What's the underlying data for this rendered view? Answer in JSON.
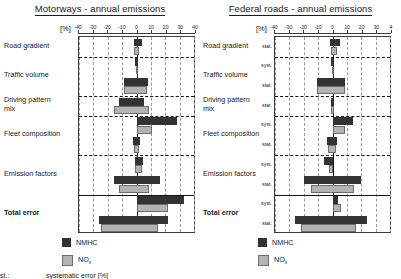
{
  "figure": {
    "footnote_key": "st.:",
    "footnote_text": "systematic error [%]"
  },
  "legend": {
    "items": [
      {
        "label": "NMHC",
        "sub": "",
        "color": "#333333",
        "name": "nmhc"
      },
      {
        "label": "NO",
        "sub": "x",
        "color": "#b3b3b3",
        "name": "nox"
      }
    ]
  },
  "axis": {
    "unit": "[%]",
    "ticks": [
      -40,
      -30,
      -20,
      -10,
      0,
      10,
      20,
      30,
      40
    ],
    "tick_labels_left": [
      "-40",
      "-30",
      "-20",
      "-10",
      "0",
      "10",
      "20",
      "30",
      "40"
    ],
    "tick_labels_right": [
      "-40",
      "-30",
      "-20",
      "-10",
      "0",
      "10",
      "20",
      "30",
      "4"
    ],
    "min": -40,
    "max": 40
  },
  "categories": [
    {
      "label": "Road gradient",
      "bold": false
    },
    {
      "label": "Traffic volume",
      "bold": false
    },
    {
      "label": "Driving pattern\nmix",
      "bold": false
    },
    {
      "label": "Fleet composition",
      "bold": false
    },
    {
      "label": "Emission factors",
      "bold": false
    },
    {
      "label": "Total error",
      "bold": true
    }
  ],
  "row_sublabels": [
    "stat.",
    "syst.",
    "stat.",
    "stat.",
    "syst.",
    "stat.",
    "syst.",
    "stat.",
    "syst.",
    "stat."
  ],
  "chart_data": [
    {
      "type": "bar",
      "orientation": "horizontal",
      "title": "Motorways - annual emissions",
      "xlabel": "[%]",
      "ylabel": "",
      "xlim": [
        -40,
        40
      ],
      "grid": true,
      "legend_position": "bottom-center",
      "categories": [
        "Road gradient",
        "Traffic volume",
        "Driving pattern mix",
        "Fleet composition",
        "Emission factors",
        "Total error"
      ],
      "rows": [
        {
          "category": "Road gradient",
          "error_type": "stat.",
          "nmhc": [
            -2.0,
            4.0
          ],
          "nox": [
            -1.5,
            2.0
          ]
        },
        {
          "category": "Traffic volume",
          "error_type": "syst.",
          "nmhc": [
            -0.8,
            0.8
          ],
          "nox": [
            -0.6,
            0.6
          ]
        },
        {
          "category": "Traffic volume",
          "error_type": "stat.",
          "nmhc": [
            -9.0,
            8.0
          ],
          "nox": [
            -9.0,
            7.0
          ]
        },
        {
          "category": "Driving pattern mix",
          "error_type": "stat.",
          "nmhc": [
            -12.0,
            5.0
          ],
          "nox": [
            -16.0,
            9.0
          ]
        },
        {
          "category": "Fleet composition",
          "error_type": "syst.",
          "nmhc": [
            0.0,
            28.0
          ],
          "nox": [
            0.0,
            11.0
          ]
        },
        {
          "category": "Fleet composition",
          "error_type": "stat.",
          "nmhc": [
            -2.5,
            2.5
          ],
          "nox": [
            -1.5,
            1.5
          ]
        },
        {
          "category": "Emission factors",
          "error_type": "syst.",
          "nmhc": [
            -1.0,
            4.5
          ],
          "nox": [
            -1.0,
            3.5
          ]
        },
        {
          "category": "Emission factors",
          "error_type": "stat.",
          "nmhc": [
            -16.0,
            16.0
          ],
          "nox": [
            -12.0,
            9.0
          ]
        },
        {
          "category": "Total error",
          "error_type": "syst.",
          "nmhc": [
            0.0,
            33.0
          ],
          "nox": [
            0.0,
            22.0
          ]
        },
        {
          "category": "Total error",
          "error_type": "stat.",
          "nmhc": [
            -26.0,
            22.0
          ],
          "nox": [
            -25.0,
            15.0
          ]
        }
      ]
    },
    {
      "type": "bar",
      "orientation": "horizontal",
      "title": "Federal roads - annual emissions",
      "xlabel": "[%]",
      "ylabel": "",
      "xlim": [
        -40,
        40
      ],
      "grid": true,
      "legend_position": "bottom-center",
      "categories": [
        "Road gradient",
        "Traffic volume",
        "Driving pattern mix",
        "Fleet composition",
        "Emission factors",
        "Total error"
      ],
      "rows": [
        {
          "category": "Road gradient",
          "error_type": "stat.",
          "nmhc": [
            -1.5,
            5.0
          ],
          "nox": [
            -1.0,
            3.0
          ]
        },
        {
          "category": "Traffic volume",
          "error_type": "syst.",
          "nmhc": [
            -0.7,
            0.9
          ],
          "nox": [
            -0.5,
            0.5
          ]
        },
        {
          "category": "Traffic volume",
          "error_type": "stat.",
          "nmhc": [
            -11.0,
            9.0
          ],
          "nox": [
            -11.0,
            9.0
          ]
        },
        {
          "category": "Driving pattern mix",
          "error_type": "stat.",
          "nmhc": [
            -1.0,
            1.0
          ],
          "nox": [
            -0.8,
            0.8
          ]
        },
        {
          "category": "Fleet composition",
          "error_type": "syst.",
          "nmhc": [
            0.0,
            14.0
          ],
          "nox": [
            0.0,
            9.0
          ]
        },
        {
          "category": "Fleet composition",
          "error_type": "stat.",
          "nmhc": [
            -4.0,
            3.0
          ],
          "nox": [
            -3.0,
            2.5
          ]
        },
        {
          "category": "Emission factors",
          "error_type": "syst.",
          "nmhc": [
            -6.0,
            0.0
          ],
          "nox": [
            -2.5,
            0.0
          ]
        },
        {
          "category": "Emission factors",
          "error_type": "stat.",
          "nmhc": [
            -20.0,
            20.0
          ],
          "nox": [
            -15.0,
            15.0
          ]
        },
        {
          "category": "Total error",
          "error_type": "syst.",
          "nmhc": [
            0.0,
            4.0
          ],
          "nox": [
            0.0,
            6.0
          ]
        },
        {
          "category": "Total error",
          "error_type": "stat.",
          "nmhc": [
            -26.0,
            24.0
          ],
          "nox": [
            -22.0,
            16.0
          ]
        }
      ]
    }
  ]
}
